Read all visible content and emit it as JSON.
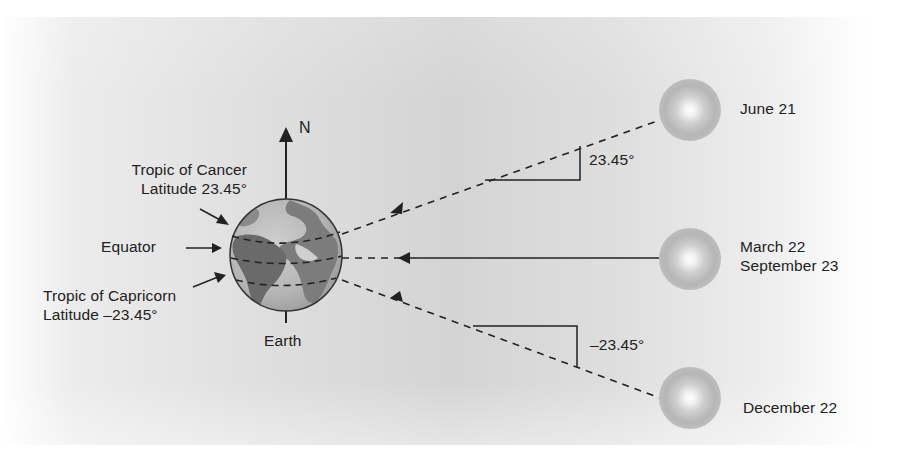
{
  "diagram": {
    "type": "earth-sun-seasons",
    "north_label": "N",
    "earth_label": "Earth",
    "earth_lines": {
      "tropic_of_cancer": {
        "name": "Tropic of Cancer",
        "latitude": "Latitude 23.45°"
      },
      "equator": {
        "name": "Equator"
      },
      "tropic_of_capricorn": {
        "name": "Tropic of Capricorn",
        "latitude": "Latitude –23.45°"
      }
    },
    "suns": [
      {
        "date_line1": "June 21",
        "date_line2": "",
        "ray_style": "dashed",
        "angle_label": "23.45°"
      },
      {
        "date_line1": "March 22",
        "date_line2": "September 23",
        "ray_style": "solid",
        "angle_label": ""
      },
      {
        "date_line1": "December 22",
        "date_line2": "",
        "ray_style": "dashed",
        "angle_label": "–23.45°"
      }
    ],
    "colors": {
      "ink": "#222222",
      "earth_land": "#6e6e6e",
      "earth_ocean": "#b9b9b9",
      "sun_outer": "#b5b5b5",
      "sun_core": "#ffffff",
      "background_center": "#d4d4d4"
    }
  }
}
